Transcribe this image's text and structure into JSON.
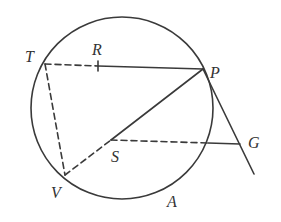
{
  "diagram": {
    "type": "geometry-circle-construction",
    "colors": {
      "stroke": "#3a3a3a",
      "label": "#333333",
      "background": "#ffffff"
    },
    "circle": {
      "cx": 122,
      "cy": 108,
      "r": 91
    },
    "points": {
      "T": {
        "label": "T",
        "x": 45,
        "y": 64
      },
      "R": {
        "label": "R",
        "x": 98,
        "y": 66
      },
      "P": {
        "label": "P",
        "x": 203,
        "y": 69
      },
      "S": {
        "label": "S",
        "x": 111,
        "y": 140
      },
      "V": {
        "label": "V",
        "x": 65,
        "y": 175
      },
      "G": {
        "label": "G",
        "x": 240,
        "y": 144
      },
      "A": {
        "label": "A"
      }
    },
    "segments": [
      {
        "from": "T",
        "to": "R",
        "style": "dashed"
      },
      {
        "from": "R",
        "to": "P",
        "style": "solid"
      },
      {
        "from": "T",
        "to": "V",
        "style": "dashed"
      },
      {
        "from": "V",
        "to": "S",
        "style": "dashed"
      },
      {
        "from": "S",
        "to": "P",
        "style": "solid"
      },
      {
        "from": "S",
        "to": "circle",
        "style": "dashed"
      },
      {
        "from": "circle",
        "to": "G",
        "style": "solid"
      },
      {
        "from": "P",
        "to": "tangent-end",
        "style": "solid"
      }
    ]
  }
}
